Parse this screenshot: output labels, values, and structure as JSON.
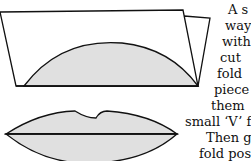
{
  "illustration": {
    "folded_card": "folded-card-with-lip-half",
    "lips": "cut-out-lips-shape",
    "fill_color": "#e0e0e0",
    "stroke_color": "#111111"
  },
  "text_lines": [
    "A s",
    "way",
    "with",
    "cut",
    "fold",
    "piece",
    "them",
    "small ‘V’ fr",
    "Then gl",
    "fold  posit"
  ]
}
